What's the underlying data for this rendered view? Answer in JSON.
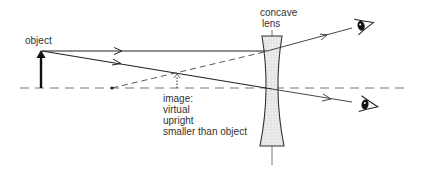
{
  "labels": {
    "object": "object",
    "lens_line1": "concave",
    "lens_line2": "lens",
    "image_title": "image:",
    "image_props": [
      "virtual",
      "upright",
      "smaller than object"
    ]
  },
  "diagram": {
    "type": "ray diagram",
    "lens_type": "concave (diverging)",
    "elements": [
      "object arrow",
      "principal axis",
      "concave lens",
      "ray parallel to axis",
      "ray through optical centre",
      "virtual ray extension",
      "virtual image",
      "upper eye",
      "lower eye"
    ]
  },
  "colors": {
    "ink": "#222222",
    "lens_fill": "#e3e3e3",
    "axis": "#777777"
  }
}
